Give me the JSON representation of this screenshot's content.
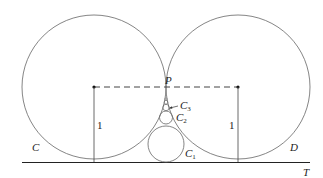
{
  "diagram": {
    "labels": {
      "circle_left": "C",
      "circle_right": "D",
      "tangent_line": "T",
      "point": "P",
      "c1": "C",
      "c1_sub": "1",
      "c2": "C",
      "c2_sub": "2",
      "c3": "C",
      "c3_sub": "3",
      "radius_left": "1",
      "radius_right": "1"
    },
    "colors": {
      "stroke": "#555555",
      "line": "#222222",
      "text": "#222222"
    }
  }
}
